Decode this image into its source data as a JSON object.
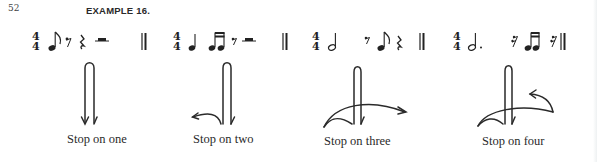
{
  "page": {
    "number": "52",
    "title": "EXAMPLE 16."
  },
  "examples": [
    {
      "time_signature": {
        "top": "4",
        "bottom": "4"
      },
      "notes": [
        "eighth-note",
        "eighth-rest",
        "quarter-rest",
        "half-rest"
      ],
      "ending": "double-barline",
      "gesture_icon": "down-stroke-arrow",
      "caption": "Stop on one"
    },
    {
      "time_signature": {
        "top": "4",
        "bottom": "4"
      },
      "notes": [
        "quarter-note",
        "two-sixteenth-notes",
        "eighth-rest",
        "half-rest"
      ],
      "ending": "double-barline",
      "gesture_icon": "down-stroke-left-curve-arrow",
      "caption": "Stop on two"
    },
    {
      "time_signature": {
        "top": "4",
        "bottom": "4"
      },
      "notes": [
        "half-note",
        "eighth-rest",
        "eighth-note",
        "quarter-rest"
      ],
      "ending": "double-barline",
      "gesture_icon": "down-stroke-cross-right-arrow",
      "caption": "Stop on three"
    },
    {
      "time_signature": {
        "top": "4",
        "bottom": "4"
      },
      "notes": [
        "dotted-half-note",
        "sixteenth-rest",
        "two-sixteenth-notes",
        "sixteenth-rest"
      ],
      "ending": "double-barline",
      "gesture_icon": "down-stroke-cross-up-arrow",
      "caption": "Stop on four"
    }
  ]
}
